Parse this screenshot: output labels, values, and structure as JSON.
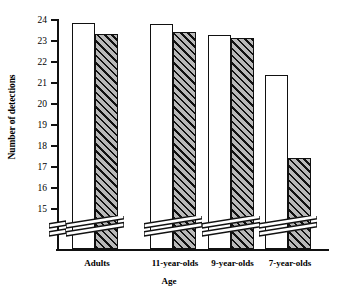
{
  "chart_data": {
    "type": "bar",
    "title": "",
    "xlabel": "Age",
    "ylabel": "Number of detections",
    "categories": [
      "Adults",
      "11-year-olds",
      "9-year-olds",
      "7-year-olds"
    ],
    "series": [
      {
        "name": "open",
        "fill": "white",
        "values": [
          23.85,
          23.8,
          23.3,
          21.4
        ]
      },
      {
        "name": "hatched",
        "fill": "diagonal-hatch",
        "values": [
          23.35,
          23.45,
          23.15,
          17.45
        ]
      }
    ],
    "ylim": [
      15,
      24
    ],
    "yticks": [
      15,
      16,
      17,
      18,
      19,
      20,
      21,
      22,
      23,
      24
    ],
    "ytick_labels": [
      "15",
      "16",
      "17",
      "18",
      "19",
      "20",
      "21",
      "22",
      "23",
      "24"
    ],
    "axis_break": true,
    "axis_break_note": "broken y-axis below 15 indicated by double diagonal slashes on axis and bars",
    "grid": false,
    "legend": "none",
    "colors": {
      "axis": "#111111",
      "bar_open_fill": "#ffffff",
      "bar_hatch_fill": "#b9b9b9",
      "bar_outline": "#111111"
    }
  }
}
